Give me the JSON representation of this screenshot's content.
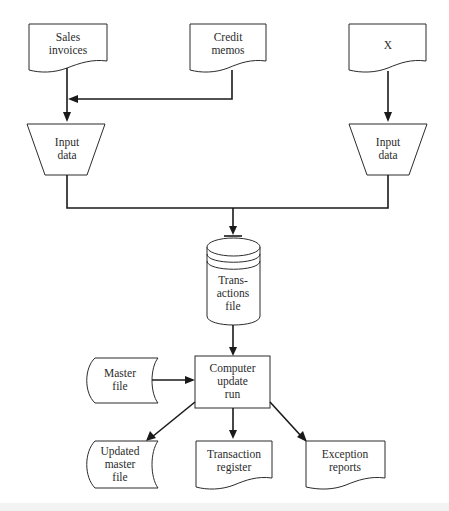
{
  "diagram": {
    "type": "system flowchart",
    "nodes": {
      "sales_invoices": {
        "shape": "document",
        "lines": [
          "Sales",
          "invoices"
        ]
      },
      "credit_memos": {
        "shape": "document",
        "lines": [
          "Credit",
          "memos"
        ]
      },
      "x_document": {
        "shape": "document",
        "lines": [
          "X"
        ]
      },
      "input_left": {
        "shape": "manual-input-trapezoid",
        "lines": [
          "Input",
          "data"
        ]
      },
      "input_right": {
        "shape": "manual-input-trapezoid",
        "lines": [
          "Input",
          "data"
        ]
      },
      "transactions_file": {
        "shape": "disk-cylinder",
        "lines": [
          "Trans-",
          "actions",
          "file"
        ]
      },
      "master_file": {
        "shape": "stored-data",
        "lines": [
          "Master",
          "file"
        ]
      },
      "computer_update": {
        "shape": "process-rectangle",
        "lines": [
          "Computer",
          "update",
          "run"
        ]
      },
      "updated_master": {
        "shape": "stored-data",
        "lines": [
          "Updated",
          "master",
          "file"
        ]
      },
      "transaction_register": {
        "shape": "document",
        "lines": [
          "Transaction",
          "register"
        ]
      },
      "exception_reports": {
        "shape": "document",
        "lines": [
          "Exception",
          "reports"
        ]
      }
    },
    "edges": [
      [
        "Sales invoices",
        "Input data (left)"
      ],
      [
        "Credit memos",
        "Input data (left)"
      ],
      [
        "X",
        "Input data (right)"
      ],
      [
        "Input data (left)",
        "Transactions file"
      ],
      [
        "Input data (right)",
        "Transactions file"
      ],
      [
        "Transactions file",
        "Computer update run"
      ],
      [
        "Master file",
        "Computer update run"
      ],
      [
        "Computer update run",
        "Updated master file"
      ],
      [
        "Computer update run",
        "Transaction register"
      ],
      [
        "Computer update run",
        "Exception reports"
      ]
    ],
    "colors": {
      "stroke": "#2b2b2b",
      "fill": "#ffffff",
      "text": "#2b2b2b"
    }
  }
}
